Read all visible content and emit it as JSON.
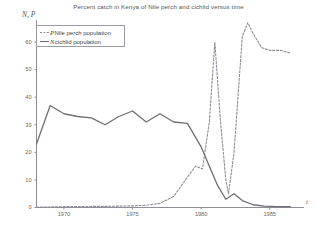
{
  "chart_data": {
    "type": "line",
    "title": "Percent catch in Kenya of Nile perch and cichlid versus time",
    "xlabel": "t",
    "ylabel": "N, P",
    "xlim": [
      1968,
      1987.5
    ],
    "ylim": [
      0,
      68
    ],
    "grid": false,
    "legend_position": "top-left",
    "xticks": [
      1970,
      1975,
      1980,
      1985
    ],
    "xtick_labels": [
      "1970",
      "1975",
      "1980",
      "1985"
    ],
    "yticks": [
      0,
      10,
      20,
      30,
      40,
      50,
      60
    ],
    "ytick_labels": [
      "0",
      "10",
      "20",
      "30",
      "40",
      "50",
      "60"
    ],
    "series": [
      {
        "name": "Nile perch population",
        "symbol": "P",
        "style": "dashed",
        "color": "#8c8c96",
        "x": [
          1968,
          1969,
          1970,
          1971,
          1972,
          1973,
          1974,
          1975,
          1976,
          1977,
          1978,
          1979,
          1979.6,
          1980.1,
          1980.6,
          1981,
          1981.4,
          1981.8,
          1982,
          1982.4,
          1982.8,
          1983,
          1983.4,
          1983.8,
          1984.4,
          1985,
          1985.8,
          1986.5
        ],
        "y": [
          0.2,
          0.2,
          0.3,
          0.3,
          0.4,
          0.4,
          0.5,
          0.6,
          0.8,
          1.5,
          4,
          11,
          15,
          14,
          31,
          60,
          32,
          10,
          5,
          20,
          48,
          62,
          67,
          63,
          58,
          57,
          57,
          56
        ]
      },
      {
        "name": "cichlid population",
        "symbol": "N",
        "style": "solid",
        "color": "#6e6e78",
        "x": [
          1968,
          1969,
          1970,
          1971,
          1972,
          1973,
          1974,
          1975,
          1976,
          1977,
          1978,
          1979,
          1980,
          1980.6,
          1981.2,
          1981.8,
          1982.4,
          1983,
          1983.8,
          1984.6,
          1985.5,
          1986.5
        ],
        "y": [
          23,
          37,
          34,
          33,
          32.5,
          30,
          33,
          35,
          31,
          34,
          31,
          30.5,
          22,
          15,
          8,
          3,
          5,
          2.5,
          1,
          0.5,
          0.3,
          0.3
        ]
      }
    ]
  },
  "legend": {
    "items": [
      {
        "symbol": "P",
        "label": "Nile perch population",
        "style": "dashed"
      },
      {
        "symbol": "N",
        "label": "cichlid population",
        "style": "solid"
      }
    ]
  }
}
